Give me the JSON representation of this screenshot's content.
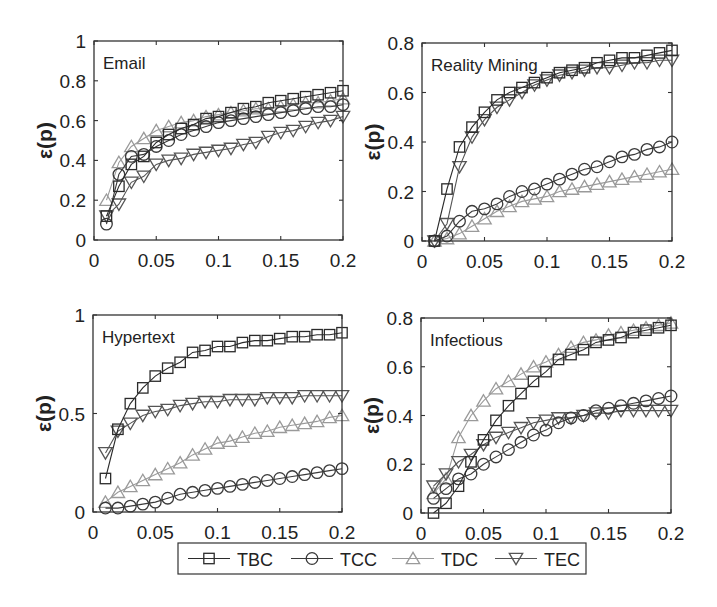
{
  "chart_data": [
    {
      "type": "line",
      "title": "Email",
      "xlabel": "",
      "ylabel": "ε(p)",
      "xlim": [
        0,
        0.2
      ],
      "ylim": [
        0,
        1
      ],
      "xticks": [
        "0",
        "0.05",
        "0.1",
        "0.15",
        "0.2"
      ],
      "yticks": [
        "0",
        "0.2",
        "0.4",
        "0.6",
        "0.8",
        "1"
      ],
      "grid": false,
      "x": [
        0.01,
        0.02,
        0.03,
        0.04,
        0.05,
        0.06,
        0.07,
        0.08,
        0.09,
        0.1,
        0.11,
        0.12,
        0.13,
        0.14,
        0.15,
        0.16,
        0.17,
        0.18,
        0.19,
        0.2
      ],
      "series": [
        {
          "name": "TBC",
          "values": [
            0.12,
            0.27,
            0.38,
            0.42,
            0.49,
            0.53,
            0.56,
            0.58,
            0.61,
            0.62,
            0.64,
            0.66,
            0.67,
            0.69,
            0.7,
            0.71,
            0.72,
            0.73,
            0.74,
            0.75
          ]
        },
        {
          "name": "TCC",
          "values": [
            0.08,
            0.33,
            0.42,
            0.43,
            0.47,
            0.5,
            0.53,
            0.55,
            0.57,
            0.59,
            0.6,
            0.61,
            0.62,
            0.63,
            0.64,
            0.65,
            0.66,
            0.67,
            0.67,
            0.68
          ]
        },
        {
          "name": "TDC",
          "values": [
            0.2,
            0.39,
            0.47,
            0.51,
            0.55,
            0.57,
            0.59,
            0.6,
            0.62,
            0.63,
            0.64,
            0.65,
            0.66,
            0.66,
            0.67,
            0.68,
            0.69,
            0.69,
            0.7,
            0.71
          ]
        },
        {
          "name": "TEC",
          "values": [
            0.12,
            0.18,
            0.29,
            0.32,
            0.38,
            0.4,
            0.41,
            0.43,
            0.44,
            0.45,
            0.46,
            0.48,
            0.49,
            0.52,
            0.54,
            0.55,
            0.57,
            0.59,
            0.6,
            0.62
          ]
        }
      ]
    },
    {
      "type": "line",
      "title": "Reality Mining",
      "xlabel": "",
      "ylabel": "ε(p)",
      "xlim": [
        0,
        0.2
      ],
      "ylim": [
        0,
        0.8
      ],
      "xticks": [
        "0",
        "0.05",
        "0.1",
        "0.15",
        "0.2"
      ],
      "yticks": [
        "0",
        "0.2",
        "0.4",
        "0.6",
        "0.8"
      ],
      "grid": false,
      "x": [
        0.01,
        0.02,
        0.03,
        0.04,
        0.05,
        0.06,
        0.07,
        0.08,
        0.09,
        0.1,
        0.11,
        0.12,
        0.13,
        0.14,
        0.15,
        0.16,
        0.17,
        0.18,
        0.19,
        0.2
      ],
      "series": [
        {
          "name": "TBC",
          "values": [
            0.0,
            0.21,
            0.38,
            0.46,
            0.52,
            0.57,
            0.6,
            0.62,
            0.64,
            0.66,
            0.68,
            0.69,
            0.7,
            0.72,
            0.73,
            0.74,
            0.74,
            0.75,
            0.76,
            0.77
          ]
        },
        {
          "name": "TCC",
          "values": [
            0.0,
            0.02,
            0.08,
            0.12,
            0.13,
            0.15,
            0.18,
            0.2,
            0.21,
            0.23,
            0.25,
            0.27,
            0.29,
            0.3,
            0.32,
            0.34,
            0.35,
            0.37,
            0.38,
            0.4
          ]
        },
        {
          "name": "TDC",
          "values": [
            0.0,
            0.01,
            0.03,
            0.06,
            0.09,
            0.12,
            0.14,
            0.16,
            0.17,
            0.18,
            0.2,
            0.21,
            0.22,
            0.23,
            0.24,
            0.25,
            0.26,
            0.27,
            0.28,
            0.29
          ]
        },
        {
          "name": "TEC",
          "values": [
            0.0,
            0.07,
            0.3,
            0.42,
            0.49,
            0.54,
            0.57,
            0.6,
            0.63,
            0.65,
            0.67,
            0.68,
            0.69,
            0.7,
            0.7,
            0.71,
            0.72,
            0.72,
            0.73,
            0.73
          ]
        }
      ]
    },
    {
      "type": "line",
      "title": "Hypertext",
      "xlabel": "",
      "ylabel": "ε(p)",
      "xlim": [
        0,
        0.2
      ],
      "ylim": [
        0,
        1
      ],
      "xticks": [
        "0",
        "0.05",
        "0.1",
        "0.15",
        "0.2"
      ],
      "yticks": [
        "0",
        "0.5",
        "1"
      ],
      "grid": false,
      "x": [
        0.01,
        0.02,
        0.03,
        0.04,
        0.05,
        0.06,
        0.07,
        0.08,
        0.09,
        0.1,
        0.11,
        0.12,
        0.13,
        0.14,
        0.15,
        0.16,
        0.17,
        0.18,
        0.19,
        0.2
      ],
      "series": [
        {
          "name": "TBC",
          "values": [
            0.17,
            0.42,
            0.55,
            0.63,
            0.69,
            0.73,
            0.76,
            0.81,
            0.82,
            0.84,
            0.84,
            0.86,
            0.87,
            0.87,
            0.88,
            0.89,
            0.89,
            0.9,
            0.9,
            0.91
          ]
        },
        {
          "name": "TCC",
          "values": [
            0.02,
            0.02,
            0.03,
            0.04,
            0.05,
            0.07,
            0.09,
            0.1,
            0.11,
            0.12,
            0.13,
            0.14,
            0.15,
            0.16,
            0.17,
            0.18,
            0.19,
            0.2,
            0.21,
            0.22
          ]
        },
        {
          "name": "TDC",
          "values": [
            0.05,
            0.1,
            0.13,
            0.16,
            0.19,
            0.22,
            0.25,
            0.29,
            0.32,
            0.35,
            0.36,
            0.38,
            0.4,
            0.41,
            0.43,
            0.44,
            0.45,
            0.46,
            0.48,
            0.49
          ]
        },
        {
          "name": "TEC",
          "values": [
            0.3,
            0.41,
            0.45,
            0.49,
            0.51,
            0.52,
            0.54,
            0.55,
            0.56,
            0.56,
            0.57,
            0.57,
            0.57,
            0.58,
            0.58,
            0.58,
            0.59,
            0.59,
            0.59,
            0.59
          ]
        }
      ]
    },
    {
      "type": "line",
      "title": "Infectious",
      "xlabel": "",
      "ylabel": "ε(p)",
      "xlim": [
        0,
        0.2
      ],
      "ylim": [
        0,
        0.8
      ],
      "xticks": [
        "0",
        "0.05",
        "0.1",
        "0.15",
        "0.2"
      ],
      "yticks": [
        "0",
        "0.2",
        "0.4",
        "0.6",
        "0.8"
      ],
      "grid": false,
      "x": [
        0.01,
        0.02,
        0.03,
        0.04,
        0.05,
        0.06,
        0.07,
        0.08,
        0.09,
        0.1,
        0.11,
        0.12,
        0.13,
        0.14,
        0.15,
        0.16,
        0.17,
        0.18,
        0.19,
        0.2
      ],
      "series": [
        {
          "name": "TBC",
          "values": [
            0.0,
            0.04,
            0.11,
            0.21,
            0.3,
            0.38,
            0.44,
            0.49,
            0.54,
            0.58,
            0.63,
            0.65,
            0.67,
            0.7,
            0.71,
            0.72,
            0.74,
            0.75,
            0.76,
            0.77
          ]
        },
        {
          "name": "TCC",
          "values": [
            0.06,
            0.1,
            0.14,
            0.16,
            0.2,
            0.23,
            0.26,
            0.29,
            0.32,
            0.34,
            0.37,
            0.39,
            0.4,
            0.42,
            0.43,
            0.44,
            0.45,
            0.46,
            0.47,
            0.48
          ]
        },
        {
          "name": "TDC",
          "values": [
            0.08,
            0.14,
            0.31,
            0.4,
            0.46,
            0.51,
            0.54,
            0.57,
            0.6,
            0.62,
            0.65,
            0.68,
            0.7,
            0.71,
            0.73,
            0.74,
            0.75,
            0.76,
            0.77,
            0.78
          ]
        },
        {
          "name": "TEC",
          "values": [
            0.11,
            0.16,
            0.21,
            0.24,
            0.28,
            0.31,
            0.33,
            0.35,
            0.37,
            0.38,
            0.39,
            0.39,
            0.4,
            0.41,
            0.41,
            0.42,
            0.42,
            0.42,
            0.42,
            0.42
          ]
        }
      ]
    }
  ],
  "legend": {
    "position": "bottom-center",
    "entries": [
      {
        "name": "TBC",
        "marker": "square"
      },
      {
        "name": "TCC",
        "marker": "circle"
      },
      {
        "name": "TDC",
        "marker": "triangle-up"
      },
      {
        "name": "TEC",
        "marker": "triangle-down"
      }
    ]
  },
  "styles": {
    "TBC": {
      "color": "#2b2b2b",
      "marker": "square"
    },
    "TCC": {
      "color": "#3a3a3a",
      "marker": "circle"
    },
    "TDC": {
      "color": "#9a9a9a",
      "marker": "triangle-up"
    },
    "TEC": {
      "color": "#555555",
      "marker": "triangle-down"
    }
  }
}
